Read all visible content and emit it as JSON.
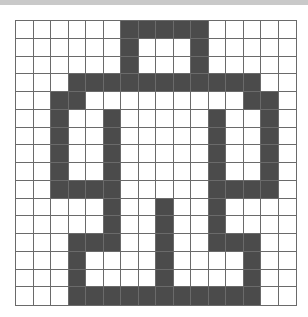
{
  "puzzle": {
    "type": "pixel-grid",
    "columns": 16,
    "rows": 16,
    "colors": {
      "filled": "#4b4b4b",
      "empty": "#ffffff",
      "grid_line": "#6a6a6a",
      "top_bar": "#c9c9c9"
    },
    "filled_cells_by_row": [
      [
        6,
        7,
        8,
        9,
        10
      ],
      [
        6,
        10
      ],
      [
        6,
        10
      ],
      [
        3,
        4,
        5,
        6,
        7,
        8,
        9,
        10,
        11,
        12,
        13
      ],
      [
        2,
        3,
        13,
        14
      ],
      [
        2,
        5,
        11,
        14
      ],
      [
        2,
        5,
        11,
        14
      ],
      [
        2,
        5,
        11,
        14
      ],
      [
        2,
        5,
        11,
        14
      ],
      [
        2,
        3,
        4,
        5,
        11,
        12,
        13,
        14
      ],
      [
        5,
        8,
        11
      ],
      [
        5,
        8,
        11
      ],
      [
        3,
        4,
        5,
        8,
        11,
        12,
        13
      ],
      [
        3,
        8,
        13
      ],
      [
        3,
        8,
        13
      ],
      [
        3,
        4,
        5,
        6,
        7,
        8,
        9,
        10,
        11,
        12,
        13
      ]
    ]
  }
}
